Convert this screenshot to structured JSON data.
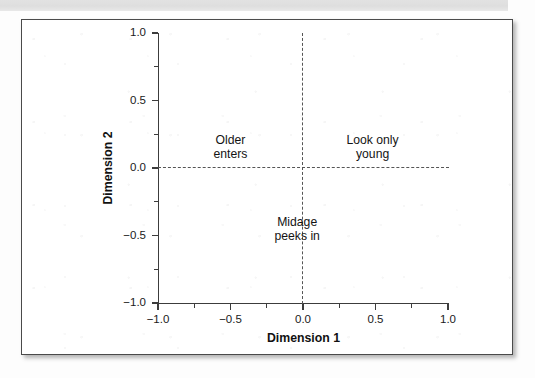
{
  "page": {
    "background_color": "#fdfdfd",
    "scan_band_color": "#e2e2e2"
  },
  "figure": {
    "frame_color": "#4a4a4a",
    "plot_background": "#ffffff"
  },
  "chart_data": {
    "type": "scatter",
    "title": "",
    "xlabel": "Dimension 1",
    "ylabel": "Dimension 2",
    "xlim": [
      -1.0,
      1.0
    ],
    "ylim": [
      -1.0,
      1.0
    ],
    "grid": false,
    "legend": null,
    "x_ticks": [
      {
        "value": -1.0,
        "label": "−1.0"
      },
      {
        "value": -0.5,
        "label": "−0.5"
      },
      {
        "value": 0.0,
        "label": "0.0"
      },
      {
        "value": 0.5,
        "label": "0.5"
      },
      {
        "value": 1.0,
        "label": "1.0"
      }
    ],
    "y_ticks": [
      {
        "value": 1.0,
        "label": "1.0"
      },
      {
        "value": 0.5,
        "label": "0.5"
      },
      {
        "value": 0.0,
        "label": "0.0"
      },
      {
        "value": -0.5,
        "label": "−0.5"
      },
      {
        "value": -1.0,
        "label": "−1.0"
      }
    ],
    "x_minor_ticks": [
      -0.75,
      -0.25,
      0.25,
      0.75
    ],
    "y_minor_ticks": [
      0.75,
      0.25,
      -0.25,
      -0.75
    ],
    "reference_lines": [
      {
        "name": "horizontal-zero-line",
        "axis": "y",
        "value": 0.0,
        "style": "dashed"
      },
      {
        "name": "vertical-zero-line",
        "axis": "x",
        "value": 0.0,
        "style": "dashed"
      }
    ],
    "values": [],
    "annotations": [
      {
        "id": "older-enters",
        "line1": "Older",
        "line2": "enters",
        "x": -0.5,
        "y": 0.15,
        "quadrant": "upper-left"
      },
      {
        "id": "look-only-young",
        "line1": "Look only",
        "line2": "young",
        "x": 0.48,
        "y": 0.15,
        "quadrant": "upper-right"
      },
      {
        "id": "midage-peeks-in",
        "line1": "Midage",
        "line2": "peeks in",
        "x": -0.04,
        "y": -0.46,
        "quadrant": "lower-center"
      }
    ]
  }
}
